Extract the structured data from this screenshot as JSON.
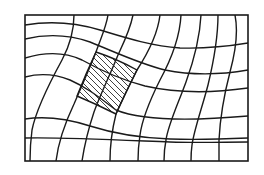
{
  "figure": {
    "colors": {
      "line": "#1a1a1a",
      "background": "#ffffff",
      "hatch": "#2a2a2a"
    },
    "frame": {
      "x": 25,
      "y": 15,
      "width": 223,
      "height": 146
    },
    "hatched_cell": {
      "corners": [
        [
          96,
          52
        ],
        [
          137,
          70
        ],
        [
          116,
          114
        ],
        [
          77,
          96
        ]
      ]
    }
  }
}
